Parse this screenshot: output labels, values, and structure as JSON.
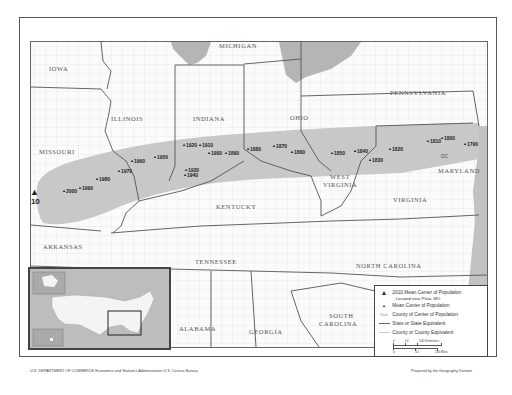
{
  "title": "Mean Center of Population for the United States: 1790 to 2010",
  "states": [
    {
      "name": "MICHIGAN",
      "x": 218,
      "y": 45
    },
    {
      "name": "IOWA",
      "x": 48,
      "y": 68
    },
    {
      "name": "ILLINOIS",
      "x": 110,
      "y": 118
    },
    {
      "name": "INDIANA",
      "x": 192,
      "y": 118
    },
    {
      "name": "OHIO",
      "x": 289,
      "y": 117
    },
    {
      "name": "PENNSYLVANIA",
      "x": 389,
      "y": 92
    },
    {
      "name": "MISSOURI",
      "x": 38,
      "y": 151
    },
    {
      "name": "WEST",
      "x": 329,
      "y": 176
    },
    {
      "name": "VIRGINIA",
      "x": 322,
      "y": 184
    },
    {
      "name": "MARYLAND",
      "x": 437,
      "y": 170
    },
    {
      "name": "KENTUCKY",
      "x": 215,
      "y": 206
    },
    {
      "name": "VIRGINIA",
      "x": 392,
      "y": 199
    },
    {
      "name": "ARKANSAS",
      "x": 42,
      "y": 246
    },
    {
      "name": "TENNESSEE",
      "x": 194,
      "y": 261
    },
    {
      "name": "NORTH CAROLINA",
      "x": 355,
      "y": 265
    },
    {
      "name": "ALABAMA",
      "x": 178,
      "y": 328
    },
    {
      "name": "GEORGIA",
      "x": 248,
      "y": 331
    },
    {
      "name": "SOUTH",
      "x": 328,
      "y": 315
    },
    {
      "name": "CAROLINA",
      "x": 318,
      "y": 323
    }
  ],
  "centers": [
    {
      "year": "2010",
      "x": 33,
      "y": 195,
      "big": true
    },
    {
      "year": "2000",
      "x": 63,
      "y": 193
    },
    {
      "year": "1990",
      "x": 79,
      "y": 190
    },
    {
      "year": "1980",
      "x": 96,
      "y": 181
    },
    {
      "year": "1970",
      "x": 118,
      "y": 173
    },
    {
      "year": "1960",
      "x": 131,
      "y": 163
    },
    {
      "year": "1950",
      "x": 154,
      "y": 159
    },
    {
      "year": "1940",
      "x": 184,
      "y": 177
    },
    {
      "year": "1930",
      "x": 185,
      "y": 172
    },
    {
      "year": "1920",
      "x": 183,
      "y": 147
    },
    {
      "year": "1910",
      "x": 199,
      "y": 147
    },
    {
      "year": "1900",
      "x": 208,
      "y": 155
    },
    {
      "year": "1890",
      "x": 225,
      "y": 155
    },
    {
      "year": "1880",
      "x": 247,
      "y": 151
    },
    {
      "year": "1870",
      "x": 273,
      "y": 148
    },
    {
      "year": "1860",
      "x": 291,
      "y": 154
    },
    {
      "year": "1850",
      "x": 331,
      "y": 155
    },
    {
      "year": "1840",
      "x": 354,
      "y": 153
    },
    {
      "year": "1830",
      "x": 369,
      "y": 162
    },
    {
      "year": "1820",
      "x": 389,
      "y": 151
    },
    {
      "year": "1810",
      "x": 427,
      "y": 143
    },
    {
      "year": "1800",
      "x": 441,
      "y": 140
    },
    {
      "year": "1790",
      "x": 464,
      "y": 146
    }
  ],
  "dc_label": "DC",
  "legend": {
    "items": [
      {
        "symbol": "▲",
        "label": "2010 Mean Center of Population",
        "sub": "Located near Plato, MO"
      },
      {
        "symbol": "▲",
        "label": "Mean Center of Population"
      },
      {
        "symbol": "Kent",
        "label": "County of Center of Population"
      },
      {
        "symbol": "line-dark",
        "label": "State or State Equivalent"
      },
      {
        "symbol": "line-light",
        "label": "County or County Equivalent"
      }
    ],
    "scale": {
      "km_labels": [
        "0",
        "50",
        "100 Kilometers"
      ],
      "mi_labels": [
        "0",
        "50",
        "100 Miles"
      ]
    }
  },
  "footer": {
    "left": "U.S. DEPARTMENT OF COMMERCE   Economics and Statistics Administration   U.S. Census Bureau",
    "right": "Prepared by the Geography Division"
  },
  "colors": {
    "band": "#c8c8c8",
    "water": "#b5b5b5",
    "state_line": "#555555",
    "county_line": "#d9d9d9"
  }
}
